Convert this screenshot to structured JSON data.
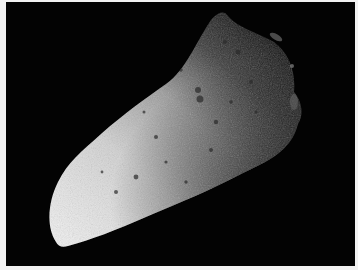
{
  "image": {
    "subject": "asteroid",
    "description": "Grayscale photograph of an elongated, cratered asteroid lit from the lower-left against a black background",
    "colors": {
      "border": "#f2f2f2",
      "background": "#030303",
      "highlight": "#e8e8e8",
      "midtone": "#8a8a8a",
      "shadow": "#1a1a1a"
    }
  }
}
